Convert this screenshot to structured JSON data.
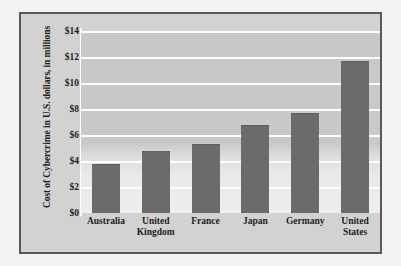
{
  "chart_data": {
    "type": "bar",
    "title": "",
    "xlabel": "",
    "ylabel": "Cost of Cybercrime in U.S. dollars, in millions",
    "categories": [
      "Australia",
      "United Kingdom",
      "France",
      "Japan",
      "Germany",
      "United States"
    ],
    "category_lines": [
      [
        "Australia"
      ],
      [
        "United",
        "Kingdom"
      ],
      [
        "France"
      ],
      [
        "Japan"
      ],
      [
        "Germany"
      ],
      [
        "United",
        "States"
      ]
    ],
    "values": [
      3.7,
      4.7,
      5.2,
      6.7,
      7.6,
      11.6
    ],
    "ylim": [
      0,
      14
    ],
    "ytick_values": [
      0,
      2,
      4,
      6,
      8,
      10,
      12,
      14
    ],
    "ytick_labels": [
      "$0",
      "$2",
      "$4",
      "$6",
      "$8",
      "$10",
      "$12",
      "$14"
    ],
    "grid": true,
    "legend": "none",
    "colors": {
      "bar": "#6b6b6b",
      "plot_background": "#c9c9c9",
      "gridline": "#fdfdfd",
      "frame_border": "#59595b",
      "figure_background": "#f3f3f3",
      "text": "#1d1d1d"
    }
  }
}
